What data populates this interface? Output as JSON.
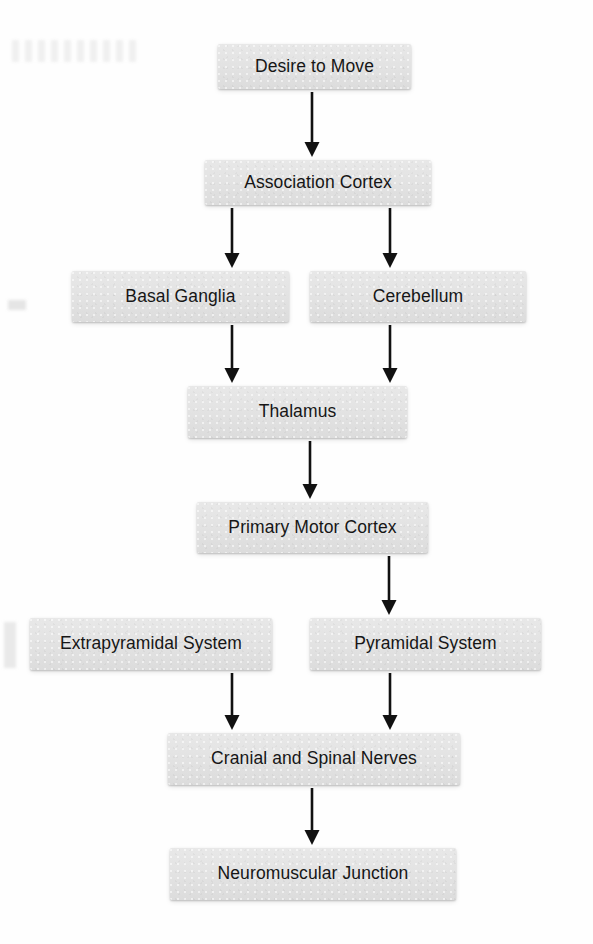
{
  "diagram": {
    "type": "flowchart",
    "background_color": "#fefefe",
    "node_fill_color": "#e4e4e4",
    "node_text_color": "#161616",
    "edge_color": "#111111",
    "nodes": [
      {
        "id": "desire-to-move",
        "label": "Desire to Move",
        "x": 218,
        "y": 44,
        "w": 193,
        "h": 45
      },
      {
        "id": "association-cortex",
        "label": "Association Cortex",
        "x": 205,
        "y": 160,
        "w": 226,
        "h": 45
      },
      {
        "id": "basal-ganglia",
        "label": "Basal Ganglia",
        "x": 72,
        "y": 271,
        "w": 217,
        "h": 51
      },
      {
        "id": "cerebellum",
        "label": "Cerebellum",
        "x": 310,
        "y": 271,
        "w": 216,
        "h": 51
      },
      {
        "id": "thalamus",
        "label": "Thalamus",
        "x": 188,
        "y": 386,
        "w": 219,
        "h": 52
      },
      {
        "id": "primary-motor-cortex",
        "label": "Primary Motor Cortex",
        "x": 197,
        "y": 502,
        "w": 231,
        "h": 51
      },
      {
        "id": "extrapyramidal-system",
        "label": "Extrapyramidal System",
        "x": 30,
        "y": 618,
        "w": 242,
        "h": 52
      },
      {
        "id": "pyramidal-system",
        "label": "Pyramidal System",
        "x": 310,
        "y": 618,
        "w": 231,
        "h": 52
      },
      {
        "id": "cranial-spinal-nerves",
        "label": "Cranial and Spinal Nerves",
        "x": 168,
        "y": 733,
        "w": 292,
        "h": 52
      },
      {
        "id": "neuromuscular-junction",
        "label": "Neuromuscular Junction",
        "x": 170,
        "y": 848,
        "w": 286,
        "h": 52
      }
    ],
    "edges": [
      {
        "id": "e1",
        "from": "desire-to-move",
        "to": "association-cortex",
        "x1": 312,
        "y1": 92,
        "x2": 312,
        "y2": 157
      },
      {
        "id": "e2",
        "from": "association-cortex",
        "to": "basal-ganglia",
        "x1": 232,
        "y1": 208,
        "x2": 232,
        "y2": 268
      },
      {
        "id": "e3",
        "from": "association-cortex",
        "to": "cerebellum",
        "x1": 390,
        "y1": 208,
        "x2": 390,
        "y2": 268
      },
      {
        "id": "e4",
        "from": "basal-ganglia",
        "to": "thalamus",
        "x1": 232,
        "y1": 325,
        "x2": 232,
        "y2": 383
      },
      {
        "id": "e5",
        "from": "cerebellum",
        "to": "thalamus",
        "x1": 390,
        "y1": 325,
        "x2": 390,
        "y2": 383
      },
      {
        "id": "e6",
        "from": "thalamus",
        "to": "primary-motor-cortex",
        "x1": 310,
        "y1": 441,
        "x2": 310,
        "y2": 499
      },
      {
        "id": "e7",
        "from": "primary-motor-cortex",
        "to": "pyramidal-system",
        "x1": 389,
        "y1": 556,
        "x2": 389,
        "y2": 615
      },
      {
        "id": "e8",
        "from": "extrapyramidal-system",
        "to": "cranial-spinal-nerves",
        "x1": 232,
        "y1": 673,
        "x2": 232,
        "y2": 730
      },
      {
        "id": "e9",
        "from": "pyramidal-system",
        "to": "cranial-spinal-nerves",
        "x1": 390,
        "y1": 673,
        "x2": 390,
        "y2": 730
      },
      {
        "id": "e10",
        "from": "cranial-spinal-nerves",
        "to": "neuromuscular-junction",
        "x1": 312,
        "y1": 788,
        "x2": 312,
        "y2": 845
      }
    ]
  }
}
